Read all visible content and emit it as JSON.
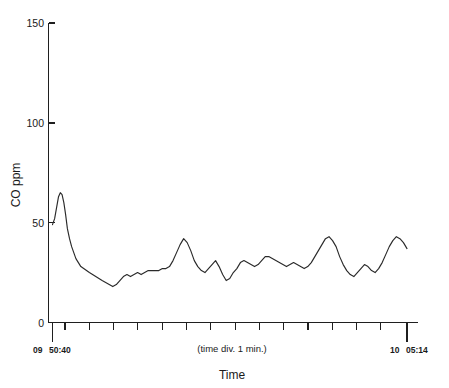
{
  "chart_data": {
    "type": "line",
    "title": "",
    "xlabel": "Time",
    "ylabel": "CO ppm",
    "ylim": [
      0,
      150
    ],
    "yticks": [
      0,
      50,
      100,
      150
    ],
    "ytick_labels": [
      "0",
      "50",
      "100",
      "150"
    ],
    "grid": false,
    "legend": "none",
    "x_axis_note": "(time div. 1 min.)",
    "x_start_label_hour": "09",
    "x_start_label_minsec": "50:40",
    "x_end_label_hour": "10",
    "x_end_label_minsec": "05:14",
    "x_start_time": "09 50:40",
    "x_end_time": "10 05:14",
    "x_tick_count": 14,
    "x_tick_interval_minutes": 1,
    "series": [
      {
        "name": "CO ppm",
        "color": "#2a2a2a",
        "x": [
          0.0,
          0.6,
          1.2,
          1.7,
          2.2,
          2.7,
          3.2,
          3.7,
          4.2,
          4.8,
          5.4,
          6.0,
          6.6,
          7.3,
          8.0,
          8.8,
          9.6,
          10.4,
          11.3,
          12.2,
          13.1,
          14.0,
          15.0,
          16.0,
          17.0,
          18.0,
          19.0,
          20.0,
          21.0,
          22.0,
          23.0,
          24.0,
          25.0,
          26.0,
          27.0,
          28.0,
          29.0,
          30.0,
          31.0,
          32.0,
          33.0,
          34.0,
          35.0,
          36.0,
          37.0,
          38.0,
          39.0,
          40.0,
          41.0,
          42.0,
          43.0,
          44.0,
          45.0,
          46.0,
          47.0,
          48.0,
          49.0,
          50.0,
          51.0,
          52.0,
          53.0,
          54.0,
          55.0,
          56.0,
          57.0,
          58.0,
          59.0,
          60.0,
          61.0,
          62.0,
          63.0,
          64.0,
          65.0,
          66.0,
          67.0,
          68.0,
          69.0,
          70.0,
          71.0,
          72.0,
          73.0,
          74.0,
          75.0,
          76.0,
          77.0,
          78.0,
          79.0,
          80.0,
          81.0,
          82.0,
          83.0,
          84.0,
          85.0,
          86.0,
          87.0,
          88.0,
          89.0,
          90.0,
          91.0,
          92.0,
          93.0,
          94.0,
          95.0,
          96.0,
          97.0,
          98.0,
          99.0,
          100.0
        ],
        "y": [
          49,
          52,
          58,
          63,
          65,
          64,
          60,
          54,
          47,
          42,
          38,
          35,
          32,
          30,
          28,
          27,
          26,
          25,
          24,
          23,
          22,
          21,
          20,
          19,
          18,
          19,
          21,
          23,
          24,
          23,
          24,
          25,
          24,
          25,
          26,
          26,
          26,
          26,
          27,
          27,
          28,
          31,
          35,
          39,
          42,
          40,
          36,
          31,
          28,
          26,
          25,
          27,
          29,
          31,
          28,
          24,
          21,
          22,
          25,
          27,
          30,
          31,
          30,
          29,
          28,
          29,
          31,
          33,
          33,
          32,
          31,
          30,
          29,
          28,
          29,
          30,
          29,
          28,
          27,
          28,
          30,
          33,
          36,
          39,
          42,
          43,
          41,
          38,
          33,
          29,
          26,
          24,
          23,
          25,
          27,
          29,
          28,
          26,
          25,
          27,
          30,
          34,
          38,
          41,
          43,
          42,
          40,
          37
        ],
        "y_min": 18,
        "y_max": 65,
        "y_start": 49,
        "y_end": 37,
        "peak_values": [
          65,
          42,
          43,
          43
        ]
      }
    ]
  },
  "figure": {
    "background_color": "#ffffff",
    "line_color": "#2a2a2a",
    "axis_color": "#1f1f1f"
  }
}
